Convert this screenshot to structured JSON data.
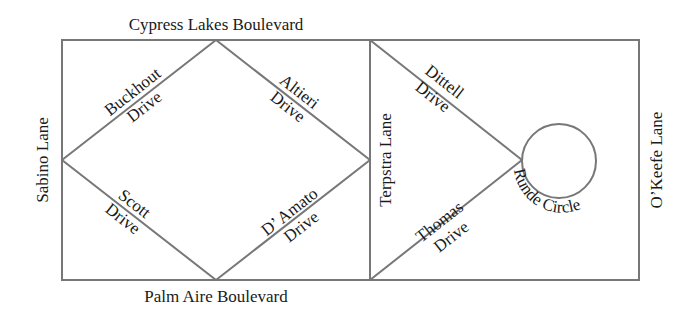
{
  "map": {
    "title": "Street map",
    "colors": {
      "street": "#777777",
      "label": "#1a1a1a",
      "background": "#ffffff"
    },
    "streets": {
      "top": "Cypress Lakes Boulevard",
      "bottom": "Palm Aire Boulevard",
      "left": "Sabino Lane",
      "right": "O’Keefe Lane",
      "middle": "Terpstra Lane",
      "buckhout": [
        "Buckhout",
        "Drive"
      ],
      "altieri": [
        "Altieri",
        "Drive"
      ],
      "scott": [
        "Scott",
        "Drive"
      ],
      "damato": [
        "D’ Amato",
        "Drive"
      ],
      "dittell": [
        "Dittell",
        "Drive"
      ],
      "thomas": [
        "Thomas",
        "Drive"
      ],
      "circle": "Runde Circle"
    }
  }
}
